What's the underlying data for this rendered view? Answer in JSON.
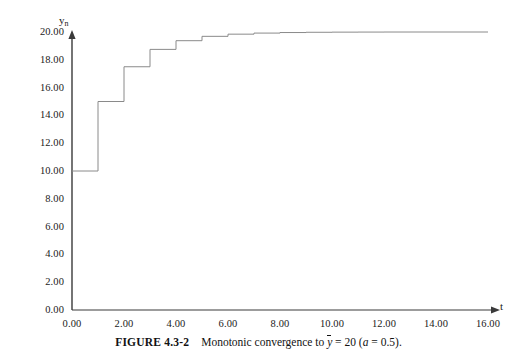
{
  "figure": {
    "caption_number": "FIGURE 4.3-2",
    "caption_text_before": "Monotonic convergence to",
    "caption_ybar": "y",
    "caption_equals": "= 20 (",
    "caption_a": "a",
    "caption_after": "= 0.5)."
  },
  "chart_data": {
    "type": "line",
    "title": "",
    "xlabel": "t",
    "ylabel": "y_n",
    "xlim": [
      0,
      16
    ],
    "ylim": [
      0,
      20
    ],
    "xticks": [
      "0.00",
      "2.00",
      "4.00",
      "6.00",
      "8.00",
      "10.00",
      "12.00",
      "14.00",
      "16.00"
    ],
    "xtick_values": [
      0,
      2,
      4,
      6,
      8,
      10,
      12,
      14,
      16
    ],
    "yticks": [
      "0.00",
      "2.00",
      "4.00",
      "6.00",
      "8.00",
      "10.00",
      "12.00",
      "14.00",
      "16.00",
      "18.00",
      "20.00"
    ],
    "ytick_values": [
      0,
      2,
      4,
      6,
      8,
      10,
      12,
      14,
      16,
      18,
      20
    ],
    "grid": false,
    "legend": "none",
    "step_style": "post",
    "line_color": "#8a8a8a",
    "axis_color": "#3a3a3a",
    "x": [
      0,
      1,
      2,
      3,
      4,
      5,
      6,
      7,
      8,
      9,
      10,
      11,
      12,
      13,
      14,
      15,
      16
    ],
    "y": [
      10.0,
      15.0,
      17.5,
      18.75,
      19.375,
      19.688,
      19.844,
      19.922,
      19.961,
      19.98,
      19.99,
      19.995,
      19.998,
      19.999,
      19.999,
      20.0,
      20.0
    ],
    "series": [
      {
        "name": "y_n",
        "values": [
          10.0,
          15.0,
          17.5,
          18.75,
          19.375,
          19.688,
          19.844,
          19.922,
          19.961,
          19.98,
          19.99,
          19.995,
          19.998,
          19.999,
          19.999,
          20.0,
          20.0
        ]
      }
    ],
    "annotations": {
      "asymptote_label": "y-bar = 20",
      "parameter": "a = 0.5"
    }
  }
}
